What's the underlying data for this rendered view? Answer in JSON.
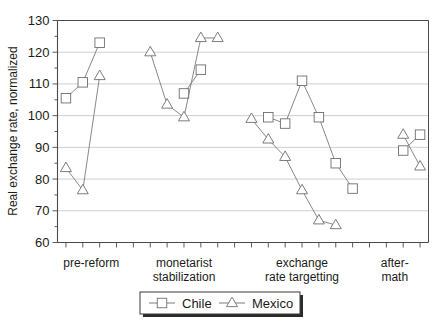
{
  "chart_data": {
    "type": "line",
    "title": "",
    "xlabel": "",
    "ylabel": "Real exchange rate, normalized",
    "ylim": [
      60,
      130
    ],
    "ytick_labels": [
      "60",
      "70",
      "80",
      "90",
      "100",
      "110",
      "120",
      "130"
    ],
    "ytick_values": [
      60,
      70,
      80,
      90,
      100,
      110,
      120,
      130
    ],
    "y_minor_step": 5,
    "grid": "horizontal",
    "legend_position": "bottom-center",
    "x_index_count": 22,
    "xlim": [
      -0.5,
      21.5
    ],
    "category_labels": [
      {
        "text_line1": "pre-reform",
        "text_line2": "",
        "center_index": 1.5
      },
      {
        "text_line1": "monetarist",
        "text_line2": "stabilization",
        "center_index": 7.0
      },
      {
        "text_line1": "exchange",
        "text_line2": "rate targetting",
        "center_index": 14.0
      },
      {
        "text_line1": "after-",
        "text_line2": "math",
        "center_index": 19.5
      }
    ],
    "series": [
      {
        "name": "Chile",
        "marker": "square",
        "color": "#6e6e6e",
        "segments": [
          {
            "x": [
              0,
              1,
              2
            ],
            "values": [
              105.5,
              110.5,
              123.0
            ]
          },
          {
            "x": [
              7,
              8
            ],
            "values": [
              107.0,
              114.5
            ]
          },
          {
            "x": [
              12,
              13,
              14,
              15,
              16,
              17
            ],
            "values": [
              99.5,
              97.5,
              111.0,
              99.5,
              85.0,
              77.0
            ]
          },
          {
            "x": [
              20,
              21
            ],
            "values": [
              89.0,
              94.0
            ]
          }
        ]
      },
      {
        "name": "Mexico",
        "marker": "triangle",
        "color": "#6e6e6e",
        "segments": [
          {
            "x": [
              0,
              1,
              2
            ],
            "values": [
              83.5,
              76.5,
              112.5
            ]
          },
          {
            "x": [
              5,
              6,
              7,
              8,
              9
            ],
            "values": [
              120.0,
              103.5,
              99.5,
              124.5,
              124.5
            ]
          },
          {
            "x": [
              11,
              12,
              13,
              14,
              15,
              16
            ],
            "values": [
              99.0,
              92.5,
              87.0,
              76.5,
              67.0,
              65.5
            ]
          },
          {
            "x": [
              20,
              21
            ],
            "values": [
              94.0,
              84.0
            ]
          }
        ]
      }
    ],
    "legend_entries": [
      {
        "label": "Chile",
        "marker": "square"
      },
      {
        "label": "Mexico",
        "marker": "triangle"
      }
    ]
  }
}
